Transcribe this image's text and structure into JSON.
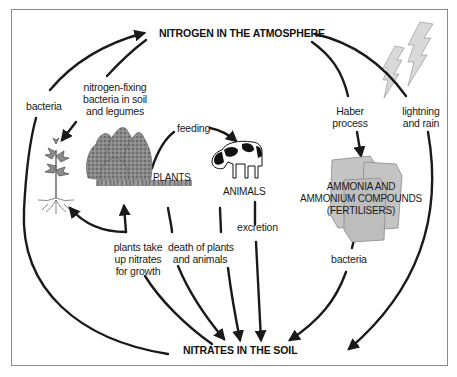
{
  "diagram": {
    "type": "cycle",
    "title_top": "NITROGEN IN THE ATMOSPHERE",
    "title_bottom": "NITRATES IN THE SOIL",
    "nodes": {
      "plants": "PLANTS",
      "animals": "ANIMALS",
      "fertilisers_line1": "AMMONIA AND",
      "fertilisers_line2": "AMMONIUM COMPOUNDS",
      "fertilisers_line3": "(FERTILISERS)"
    },
    "arrow_labels": {
      "bacteria_left": "bacteria",
      "nitrogen_fixing_line1": "nitrogen-fixing",
      "nitrogen_fixing_line2": "bacteria in soil",
      "nitrogen_fixing_line3": "and legumes",
      "feeding": "feeding",
      "haber_line1": "Haber",
      "haber_line2": "process",
      "lightning_line1": "lightning",
      "lightning_line2": "and rain",
      "excretion": "excretion",
      "plants_take_line1": "plants take",
      "plants_take_line2": "up nitrates",
      "plants_take_line3": "for growth",
      "death_line1": "death of plants",
      "death_line2": "and animals",
      "bacteria_right": "bacteria"
    },
    "icons": [
      "seedling-icon",
      "trees-icon",
      "grass-icon",
      "cow-icon",
      "fertiliser-bags-icon",
      "lightning-icon"
    ],
    "colors": {
      "arrow": "#1a1a1a",
      "frame": "#8a8a8a",
      "trees": "#7d7d7d",
      "bags": "#c4c4c4",
      "lightning": "#d6d6d6"
    }
  }
}
